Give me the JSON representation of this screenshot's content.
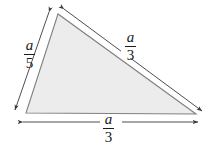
{
  "figure": {
    "kind": "geometry-diagram",
    "background_color": "#ffffff",
    "fill_color": "#ececec",
    "stroke_color": "#6e6e6e",
    "dimension_color": "#3a3a3a",
    "text_color": "#1a1a1a",
    "triangle": {
      "vertices": [
        {
          "name": "apex",
          "x": 58,
          "y": 14
        },
        {
          "name": "bottom-left",
          "x": 26,
          "y": 113
        },
        {
          "name": "bottom-right",
          "x": 196,
          "y": 114
        }
      ]
    },
    "dimensions": [
      {
        "name": "left-side",
        "numerator": "a",
        "denominator": "5",
        "arrows": "both",
        "from": {
          "x": 49,
          "y": 12
        },
        "to": {
          "x": 15,
          "y": 110
        }
      },
      {
        "name": "hypotenuse",
        "numerator": "a",
        "denominator": "3",
        "arrows": "both",
        "from": {
          "x": 64,
          "y": 9
        },
        "to": {
          "x": 202,
          "y": 111
        }
      },
      {
        "name": "base",
        "numerator": "a",
        "denominator": "3",
        "arrows": "both",
        "from": {
          "x": 23,
          "y": 122
        },
        "to": {
          "x": 198,
          "y": 122
        }
      }
    ]
  }
}
